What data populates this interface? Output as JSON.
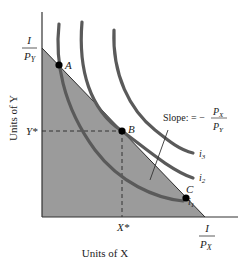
{
  "diagram": {
    "type": "consumer-choice-indifference-curves",
    "axes": {
      "x_label": "Units of X",
      "y_label": "Units of Y",
      "x_intercept_label": {
        "numerator": "I",
        "denominator": "P",
        "denominator_sub": "X"
      },
      "y_intercept_label": {
        "numerator": "I",
        "denominator": "P",
        "denominator_sub": "Y"
      },
      "x_star_label": "X*",
      "y_star_label": "Y*"
    },
    "budget_line": {
      "slope_label_prefix": "Slope: = −",
      "slope_numerator": "P",
      "slope_numerator_sub": "X",
      "slope_denominator": "P",
      "slope_denominator_sub": "Y"
    },
    "points": [
      {
        "name": "A",
        "label": "A"
      },
      {
        "name": "B",
        "label": "B"
      },
      {
        "name": "C",
        "label": "C"
      }
    ],
    "indifference_curves": [
      {
        "name": "i1",
        "label": "i",
        "sub": "1"
      },
      {
        "name": "i2",
        "label": "i",
        "sub": "2"
      },
      {
        "name": "i3",
        "label": "i",
        "sub": "3"
      }
    ],
    "colors": {
      "shaded_region": "#9a9a9a",
      "curve": "#5a5a5a",
      "axis": "#333333",
      "point": "#000000"
    }
  }
}
